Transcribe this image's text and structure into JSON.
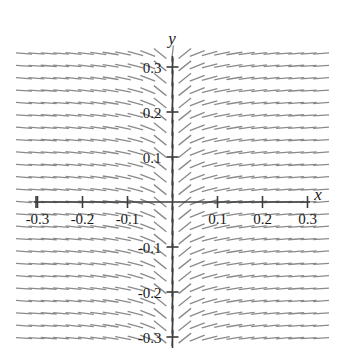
{
  "chart_data": {
    "type": "line",
    "title": "",
    "subtitle": "",
    "xlabel": "x",
    "ylabel": "y",
    "xlim": [
      -0.35,
      0.35
    ],
    "ylim": [
      -0.35,
      0.35
    ],
    "grid": false,
    "legend": null,
    "plot_kind": "slope-field",
    "slope_rule": "dy/dx proportional to 1/x",
    "x_ticks": [
      -0.3,
      -0.2,
      -0.1,
      0.1,
      0.2,
      0.3
    ],
    "x_tick_labels": [
      "-0.3",
      "-0.2",
      "-0.1",
      "0.1",
      "0.2",
      "0.3"
    ],
    "y_ticks": [
      -0.3,
      -0.2,
      -0.1,
      0.1,
      0.2,
      0.3
    ],
    "y_tick_labels": [
      "-0.3",
      "-0.2",
      "-0.1",
      "0.1",
      "0.2",
      "0.3"
    ],
    "field": {
      "x_start": -0.33,
      "x_end": 0.33,
      "y_start": -0.33,
      "y_end": 0.33,
      "x_step": 0.0275,
      "y_step": 0.0275,
      "segment_length_px": 16,
      "segment_color": "#8a8a8a",
      "segment_width_px": 1.3,
      "max_abs_slope": 9.0,
      "slope_scale": 0.022
    },
    "axis_color": "#3c3c3c",
    "axis_width_px": 1.6,
    "tick_half_len_px": 6,
    "text_color": "#1a1a1a"
  },
  "figure": {
    "x_axis_label": "x",
    "y_axis_label": "y",
    "background": "#ffffff"
  }
}
